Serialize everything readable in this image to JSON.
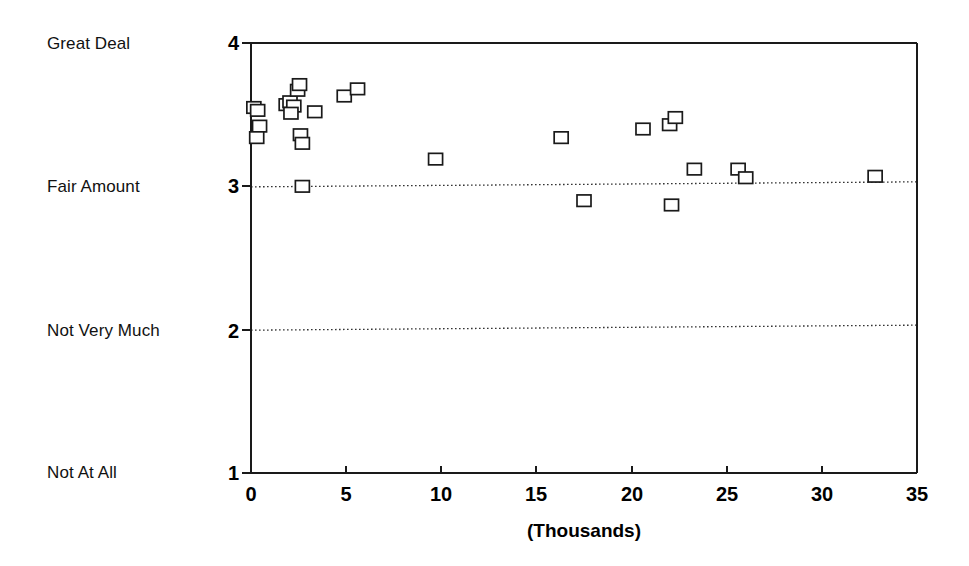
{
  "chart_data": {
    "type": "scatter",
    "title": "",
    "subtitle": "",
    "xlabel": "(Thousands)",
    "ylabel": "",
    "xlim": [
      0,
      35
    ],
    "ylim": [
      1,
      4
    ],
    "grid": "horizontal dotted at y=2 and y=3",
    "legend": "none",
    "marker_style": "open square",
    "x_ticks": [
      0,
      5,
      10,
      15,
      20,
      25,
      30,
      35
    ],
    "x_tick_labels": [
      "0",
      "5",
      "10",
      "15",
      "20",
      "25",
      "30",
      "35"
    ],
    "y_ticks": [
      1,
      2,
      3,
      4
    ],
    "y_tick_labels": [
      "1",
      "2",
      "3",
      "4"
    ],
    "y_category_labels": [
      {
        "value": 4,
        "label": "Great Deal"
      },
      {
        "value": 3,
        "label": "Fair Amount"
      },
      {
        "value": 2,
        "label": "Not Very Much"
      },
      {
        "value": 1,
        "label": "Not At All"
      }
    ],
    "gridline_values": [
      3,
      2
    ],
    "n_points": 29,
    "points": [
      {
        "x": 0.15,
        "y": 3.55
      },
      {
        "x": 0.35,
        "y": 3.53
      },
      {
        "x": 0.45,
        "y": 3.42
      },
      {
        "x": 0.3,
        "y": 3.34
      },
      {
        "x": 1.85,
        "y": 3.57
      },
      {
        "x": 2.05,
        "y": 3.59
      },
      {
        "x": 2.25,
        "y": 3.56
      },
      {
        "x": 2.1,
        "y": 3.51
      },
      {
        "x": 2.45,
        "y": 3.67
      },
      {
        "x": 2.55,
        "y": 3.71
      },
      {
        "x": 3.35,
        "y": 3.52
      },
      {
        "x": 2.6,
        "y": 3.36
      },
      {
        "x": 2.7,
        "y": 3.3
      },
      {
        "x": 2.7,
        "y": 3.0
      },
      {
        "x": 4.9,
        "y": 3.63
      },
      {
        "x": 5.6,
        "y": 3.68
      },
      {
        "x": 9.7,
        "y": 3.19
      },
      {
        "x": 16.3,
        "y": 3.34
      },
      {
        "x": 17.5,
        "y": 2.9
      },
      {
        "x": 20.6,
        "y": 3.4
      },
      {
        "x": 22.0,
        "y": 3.43
      },
      {
        "x": 22.3,
        "y": 3.48
      },
      {
        "x": 22.1,
        "y": 2.87
      },
      {
        "x": 23.3,
        "y": 3.12
      },
      {
        "x": 25.6,
        "y": 3.12
      },
      {
        "x": 26.0,
        "y": 3.06
      },
      {
        "x": 32.8,
        "y": 3.07
      }
    ]
  },
  "axes": {
    "x_title": "(Thousands)"
  }
}
